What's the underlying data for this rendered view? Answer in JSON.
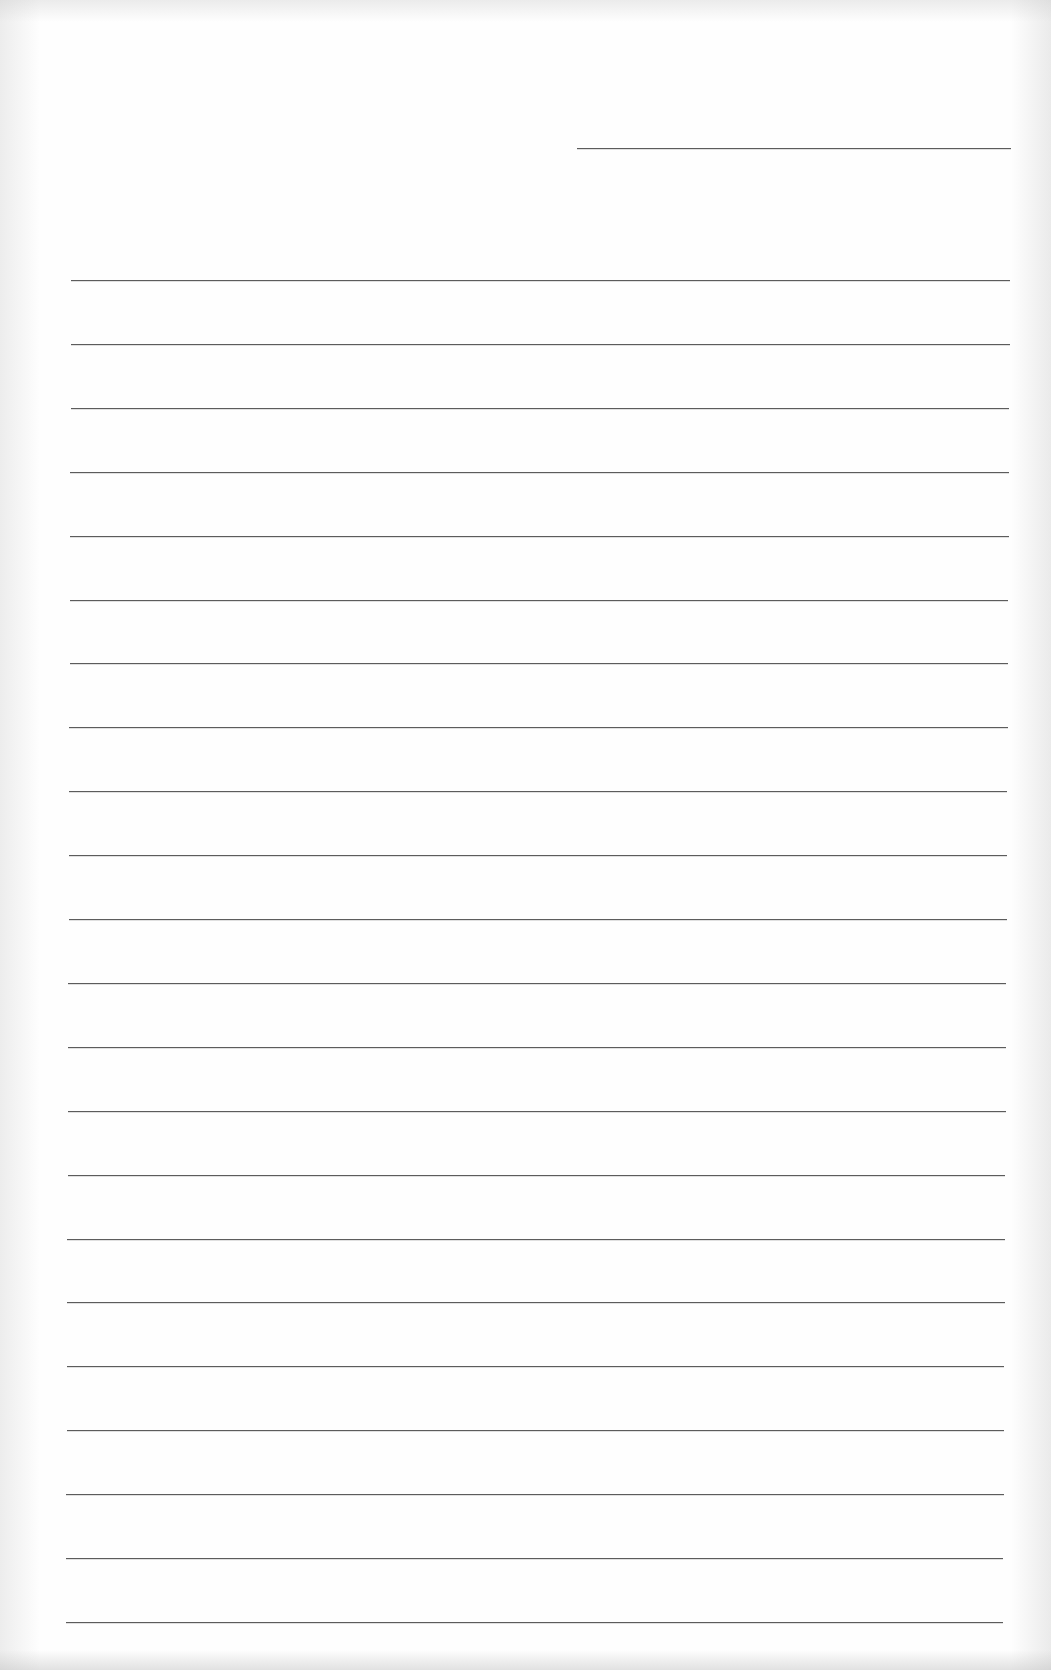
{
  "document": {
    "type": "lined-writing-paper",
    "colors": {
      "paper": "#fefefe",
      "rule": "#5c5c5c",
      "scan_edge": "#d0d0d0"
    },
    "header_line": {
      "x1": 577,
      "x2": 1011,
      "y": 148,
      "text": ""
    },
    "ruled_lines": {
      "count": 22,
      "first_y": 280,
      "spacing": 63.9,
      "left_top": 71,
      "left_bottom": 66,
      "right_top": 1010,
      "right_bottom": 1003,
      "lines_text": [
        "",
        "",
        "",
        "",
        "",
        "",
        "",
        "",
        "",
        "",
        "",
        "",
        "",
        "",
        "",
        "",
        "",
        "",
        "",
        "",
        "",
        ""
      ]
    }
  }
}
